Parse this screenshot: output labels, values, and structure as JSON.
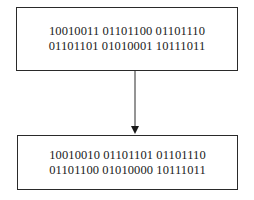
{
  "diagram": {
    "type": "flow",
    "direction": "top-to-bottom",
    "nodes": [
      {
        "id": "source",
        "lines": [
          "10010011 01101100 01101110",
          "01101101 01010001 10111011"
        ]
      },
      {
        "id": "result",
        "lines": [
          "10010010 01101101 01101110",
          "01101100 01010000 10111011"
        ]
      }
    ],
    "edges": [
      {
        "from": "source",
        "to": "result",
        "style": "arrow"
      }
    ],
    "colors": {
      "stroke": "#2a2a2a",
      "text": "#1a1a1a",
      "background": "#ffffff"
    }
  }
}
